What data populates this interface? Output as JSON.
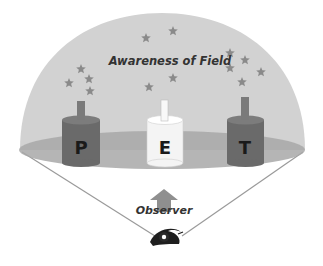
{
  "diagram": {
    "title": "Awareness of Field",
    "observer_label": "Observer",
    "cylinders": [
      {
        "letter": "P",
        "color": "#6a6a6a",
        "top": "#7c7c7c",
        "stem": "#7a7a7a"
      },
      {
        "letter": "E",
        "color": "#f4f4f4",
        "top": "#ffffff",
        "stem": "#f8f8f8"
      },
      {
        "letter": "T",
        "color": "#6a6a6a",
        "top": "#7c7c7c",
        "stem": "#7a7a7a"
      }
    ],
    "colors": {
      "dome": "#d2d2d2",
      "disc": "#a8a8a8",
      "star": "#8a8a8a",
      "arrow": "#8f8f8f",
      "lines": "#9a9a9a"
    },
    "icons": [
      "star-icon",
      "arrow-up-icon",
      "eye-icon"
    ]
  }
}
